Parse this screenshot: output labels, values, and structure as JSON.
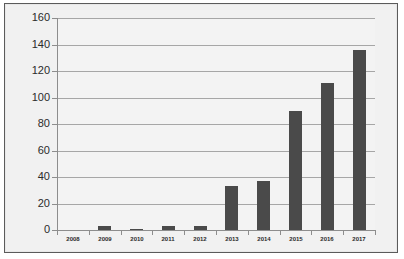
{
  "chart_data": {
    "type": "bar",
    "title": "",
    "subtitle": "",
    "xlabel": "",
    "ylabel": "",
    "categories": [
      "2008",
      "2009",
      "2010",
      "2011",
      "2012",
      "2013",
      "2014",
      "2015",
      "2016",
      "2017"
    ],
    "values": [
      0,
      3,
      1,
      3,
      3,
      33,
      37,
      90,
      111,
      136
    ],
    "ylim": [
      0,
      160
    ],
    "yticks": [
      0,
      20,
      40,
      60,
      80,
      100,
      120,
      140,
      160
    ],
    "ytick_labels": [
      "0",
      "20",
      "40",
      "60",
      "80",
      "100",
      "120",
      "140",
      "160"
    ],
    "grid": true,
    "grid_axis": "y",
    "legend": false,
    "legend_position": "none",
    "bar_color": "#4a4a4a",
    "plot_background": "#f3f3f3",
    "gridline_color": "#a6a6a6",
    "axis_color": "#8d8d8d",
    "frame_border_color": "#5b5b5b",
    "series": [
      {
        "name": "",
        "values": [
          0,
          3,
          1,
          3,
          3,
          33,
          37,
          90,
          111,
          136
        ]
      }
    ]
  }
}
